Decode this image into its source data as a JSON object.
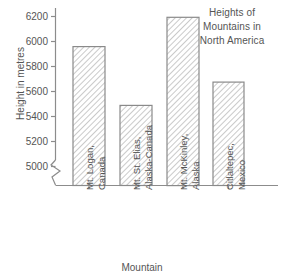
{
  "chart_data": {
    "type": "bar",
    "title": "Heights of Mountains in North America",
    "title_lines": [
      "Heights of",
      "Mountains in",
      "North America"
    ],
    "xlabel": "Mountain",
    "ylabel": "Height in metres",
    "categories": [
      "Mt. Logan, Canada",
      "Mt. St. Elias, Alaska-Canada",
      "Mt. McKinley, Alaska",
      "Citlaltepec, Mexico"
    ],
    "category_lines": [
      [
        "Mt. Logan,",
        "Canada"
      ],
      [
        "Mt. St. Elias,",
        "Alaska-Canada"
      ],
      [
        "Mt. McKinley,",
        "Alaska"
      ],
      [
        "Citlaltepec,",
        "Mexico"
      ]
    ],
    "values": [
      5959,
      5489,
      6194,
      5675
    ],
    "ylim": [
      4900,
      6280
    ],
    "yticks": [
      5000,
      5200,
      5400,
      5600,
      5800,
      6000,
      6200
    ],
    "ytick_labels": [
      "5000",
      "5200",
      "5400",
      "5600",
      "5800",
      "6000",
      "6200"
    ],
    "grid": false,
    "legend": "none",
    "axis_break": true,
    "bar_fill": "diagonal-hatch",
    "colors": {
      "axis": "#8c8c8c",
      "text": "#555555",
      "bar_border": "#8a8a8a",
      "bar_hatch": "#b0b0b0",
      "background": "#ffffff"
    }
  }
}
